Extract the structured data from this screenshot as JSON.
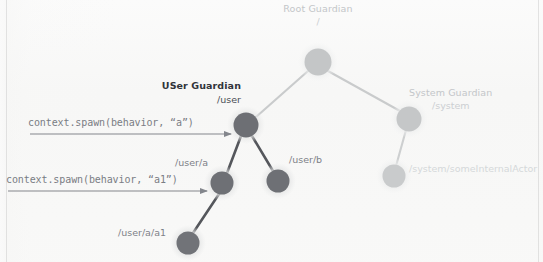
{
  "diagram": {
    "title_semantic": "actor-hierarchy-tree",
    "background_color": "#f7f7f6",
    "colors": {
      "node_dark": "#6e7075",
      "node_light": "#c8cacb",
      "node_halo": "#e6e7e7",
      "edge_dark": "#55575c",
      "edge_light": "#c9cbcc",
      "annotation_gray": "#7a7d84",
      "label_dark": "#31333a",
      "label_faint": "#c6c9cc"
    },
    "nodes": [
      {
        "id": "root",
        "name": "Root Guardian",
        "path": "/",
        "x": 318,
        "y": 62,
        "r": 13,
        "tone": "light"
      },
      {
        "id": "user",
        "name": "USer Guardian",
        "path": "/user",
        "x": 246,
        "y": 125,
        "r": 12,
        "tone": "dark"
      },
      {
        "id": "system",
        "name": "System Guardian",
        "path": "/system",
        "x": 409,
        "y": 119,
        "r": 12,
        "tone": "light"
      },
      {
        "id": "user_a",
        "name": "",
        "path": "/user/a",
        "x": 222,
        "y": 183,
        "r": 11,
        "tone": "dark"
      },
      {
        "id": "user_b",
        "name": "",
        "path": "/user/b",
        "x": 278,
        "y": 181,
        "r": 11,
        "tone": "dark"
      },
      {
        "id": "user_a_a1",
        "name": "",
        "path": "/user/a/a1",
        "x": 188,
        "y": 243,
        "r": 11,
        "tone": "dark"
      },
      {
        "id": "system_internal",
        "name": "",
        "path": "/system/someInternalActor",
        "x": 394,
        "y": 176,
        "r": 11,
        "tone": "light"
      }
    ],
    "edges": [
      {
        "from": "root",
        "to": "user",
        "tone": "light"
      },
      {
        "from": "root",
        "to": "system",
        "tone": "light"
      },
      {
        "from": "user",
        "to": "user_a",
        "tone": "dark"
      },
      {
        "from": "user",
        "to": "user_b",
        "tone": "dark"
      },
      {
        "from": "user_a",
        "to": "user_a_a1",
        "tone": "dark"
      },
      {
        "from": "system",
        "to": "system_internal",
        "tone": "light"
      }
    ],
    "annotations": [
      {
        "id": "spawn-a",
        "text": "context.spawn(behavior, “a”)",
        "target": "/user",
        "arrow_from_x": 30,
        "arrow_to_x": 233,
        "arrow_y": 134
      },
      {
        "id": "spawn-a1",
        "text": "context.spawn(behavior, “a1”)",
        "target": "/user/a",
        "arrow_from_x": 8,
        "arrow_to_x": 209,
        "arrow_y": 191
      }
    ],
    "labels": {
      "root_title": "Root Guardian",
      "root_path": "/",
      "user_title": "USer Guardian",
      "user_path": "/user",
      "system_title": "System Guardian",
      "system_path": "/system",
      "user_a_path": "/user/a",
      "user_b_path": "/user/b",
      "user_a_a1_path": "/user/a/a1",
      "system_internal_path": "/system/someInternalActor",
      "spawn_a_code": "context.spawn(behavior, “a”)",
      "spawn_a1_code": "context.spawn(behavior, “a1”)"
    }
  }
}
